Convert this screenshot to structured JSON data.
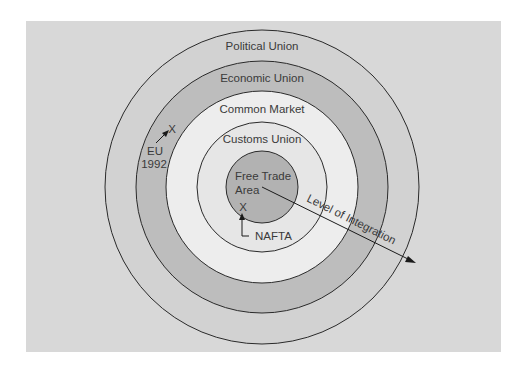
{
  "diagram": {
    "rings": [
      {
        "label": "Political Union",
        "radius": 157,
        "fill": "#d2d2d2"
      },
      {
        "label": "Economic Union",
        "radius": 125,
        "fill": "#bfbfbf"
      },
      {
        "label": "Common Market",
        "radius": 95,
        "fill": "#ececec"
      },
      {
        "label": "Customs Union",
        "radius": 64,
        "fill": "#e4e4e4"
      },
      {
        "label": "Free Trade Area",
        "radius": 33,
        "fill": "#b0b0b0"
      }
    ],
    "labels": {
      "political_union": "Political Union",
      "economic_union": "Economic Union",
      "common_market": "Common Market",
      "customs_union": "Customs Union",
      "free_trade_line1": "Free Trade",
      "free_trade_line2": "Area",
      "eu_line1": "EU",
      "eu_line2": "1992",
      "eu_marker": "X",
      "nafta": "NAFTA",
      "nafta_marker": "X",
      "axis": "Level of Integration"
    },
    "colors": {
      "background": "#d8d8d8",
      "stroke": "#2a2a2a",
      "text": "#3a3a3a"
    }
  }
}
